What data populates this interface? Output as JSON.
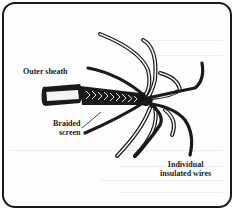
{
  "diagram": {
    "colors": {
      "ink": "#1a1a1a",
      "background": "#fdfdfd",
      "border": "#1a1a1a"
    },
    "labels": {
      "outer_sheath": "Outer sheath",
      "braided_screen_line1": "Braided",
      "braided_screen_line2": "screen",
      "wires_line1": "Individual",
      "wires_line2": "insulated wires"
    }
  }
}
